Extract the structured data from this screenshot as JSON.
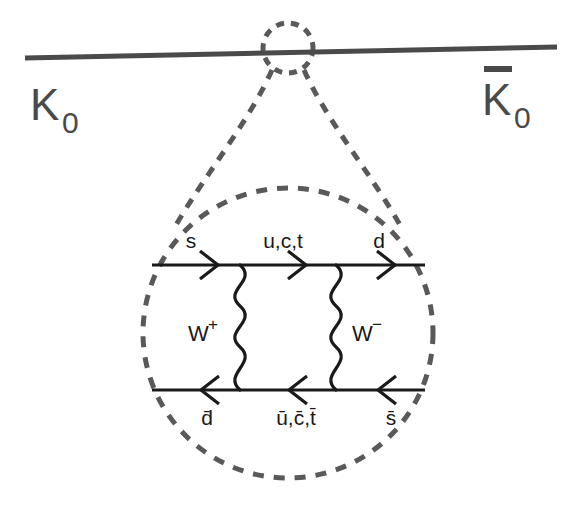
{
  "figure": {
    "kind": "feynman-diagram",
    "background_color": "#ffffff",
    "solid_line_color": "#1a1a1a",
    "dashed_line_color": "#595959",
    "meson_label_color": "#4a4a4a"
  },
  "external": {
    "left_meson": {
      "symbol": "K",
      "subscript": "0",
      "has_overbar": false
    },
    "right_meson": {
      "symbol": "K",
      "subscript": "0",
      "has_overbar": true
    }
  },
  "quark_lines": {
    "top": {
      "direction": "right",
      "labels": [
        "s",
        "u,c,t",
        "d"
      ]
    },
    "bottom": {
      "direction": "left",
      "labels": [
        "d̄",
        "ū,c̄,t̄",
        "s̄"
      ]
    }
  },
  "bosons": [
    {
      "symbol": "W",
      "charge": "+",
      "side": "left"
    },
    {
      "symbol": "W",
      "charge": "−",
      "side": "right"
    }
  ],
  "geometry": {
    "meson_line": {
      "x1": 25,
      "y1": 58,
      "x2": 557,
      "y2": 47
    },
    "top_circle": {
      "cx": 288,
      "cy": 48,
      "r": 25
    },
    "loop_circle": {
      "cx": 288,
      "cy": 333,
      "r": 145
    },
    "top_quark_line_y": 265,
    "bottom_quark_line_y": 390,
    "quark_line_x1": 152,
    "quark_line_x2": 425,
    "left_boson_x": 240,
    "right_boson_x": 336
  }
}
